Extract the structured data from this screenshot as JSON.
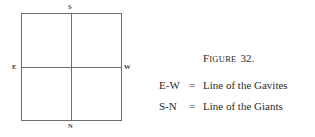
{
  "figure": {
    "caption_prefix": "F",
    "caption_word_rest": "IGURE",
    "caption_number": "32.",
    "caption_full": "Figure 32."
  },
  "diagram": {
    "type": "square-with-crosshair",
    "cardinals": {
      "north": "N",
      "south": "S",
      "east": "E",
      "west": "W"
    },
    "line_color": "#6e6e6e"
  },
  "legend": {
    "rows": [
      {
        "key": "E-W",
        "equals": "=",
        "value": "Line of the Gavites"
      },
      {
        "key": "S-N",
        "equals": "=",
        "value": "Line of the Giants"
      }
    ]
  },
  "colors": {
    "background": "#ffffff",
    "text": "#2b2b2b",
    "rule": "#6e6e6e"
  }
}
